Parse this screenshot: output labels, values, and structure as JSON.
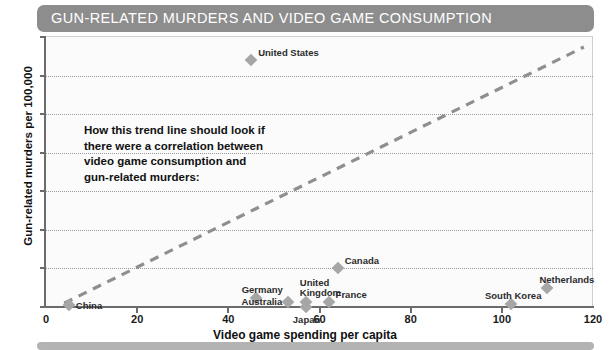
{
  "title": "GUN-RELATED MURDERS AND VIDEO GAME CONSUMPTION",
  "annotation": "How this trend line should look if\nthere were a correlation between\nvideo game consumption and\ngun-related murders:",
  "colors": {
    "banner": "#8d8d8d",
    "marker": "#a6a6a6",
    "trend_line": "#8f8f8f",
    "axis": "#6b6b6b",
    "gridline": "#9a9aa0",
    "plot_background": "#fbfbfb",
    "title_text": "#ffffff"
  },
  "chart_data": {
    "type": "scatter",
    "title": "GUN-RELATED MURDERS AND VIDEO GAME CONSUMPTION",
    "xlabel": "Video game spending per capita",
    "ylabel": "Gun-related murders per 100,000",
    "xlim": [
      0,
      120
    ],
    "ylim": [
      0,
      3.5
    ],
    "xticks": [
      0,
      20,
      40,
      60,
      80,
      100,
      120
    ],
    "yticks": [
      0,
      0.5,
      1,
      1.5,
      2,
      2.5,
      3,
      3.5
    ],
    "xtick_labels": [
      "0",
      "20",
      "40",
      "60",
      "80",
      "100",
      "120"
    ],
    "ytick_labels": [
      "0",
      "0.5",
      "1",
      "1.5",
      "2",
      "2.5",
      "3",
      "3.5"
    ],
    "grid": "horizontal-dotted",
    "legend": "none",
    "points": [
      {
        "label": "United States",
        "x": 45,
        "y": 3.2,
        "label_dx": 7,
        "label_dy": -12
      },
      {
        "label": "Canada",
        "x": 64,
        "y": 0.5,
        "label_dx": 7,
        "label_dy": -12
      },
      {
        "label": "Germany",
        "x": 46,
        "y": 0.12,
        "label_dx": -14,
        "label_dy": -13
      },
      {
        "label": "United\nKingdom",
        "x": 57,
        "y": 0.06,
        "label_dx": -6,
        "label_dy": -24
      },
      {
        "label": "France",
        "x": 62,
        "y": 0.06,
        "label_dx": 7,
        "label_dy": -12
      },
      {
        "label": "Australia",
        "x": 53,
        "y": 0.06,
        "label_dx": -46,
        "label_dy": -5
      },
      {
        "label": "Japan",
        "x": 57,
        "y": 0.0,
        "label_dx": -13,
        "label_dy": 8
      },
      {
        "label": "China",
        "x": 5,
        "y": 0.03,
        "label_dx": 7,
        "label_dy": -4
      },
      {
        "label": "South Korea",
        "x": 102,
        "y": 0.04,
        "label_dx": -26,
        "label_dy": -13
      },
      {
        "label": "Netherlands",
        "x": 110,
        "y": 0.25,
        "label_dx": -8,
        "label_dy": -13
      }
    ],
    "trend_line": {
      "style": "dashed",
      "x_start": 4,
      "y_start": 0.05,
      "x_end": 118,
      "y_end": 3.37,
      "annotation": "How this trend line should look if there were a correlation between video game consumption and gun-related murders:"
    }
  }
}
